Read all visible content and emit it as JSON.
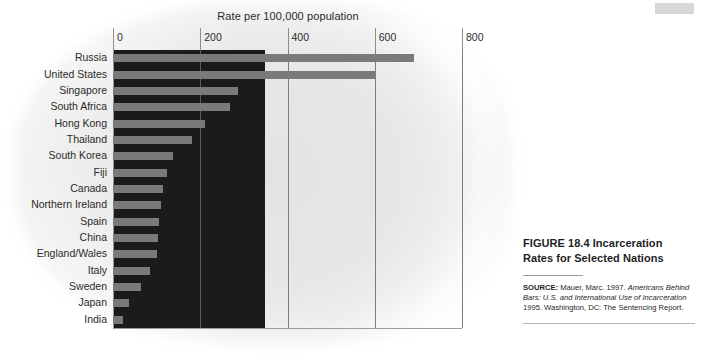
{
  "figure": {
    "caption_title": "FIGURE 18.4 Incarceration Rates for Selected Nations",
    "source_lead": "SOURCE:",
    "source_part1": " Mauer, Marc. 1997. ",
    "source_italic": "Americans Behind Bars: U.S. and International Use of Incarceration",
    "source_part2": " 1995. Washington, DC: The Sentencing Report."
  },
  "colors": {
    "bar": "#7a7a7a",
    "plot_dark": "#1b1b1b",
    "grid": "#7d7d7d",
    "text": "#2b2b2b",
    "corner_tab": "#d8d8d8"
  },
  "chart_data": {
    "type": "bar",
    "orientation": "horizontal",
    "title": "Rate per 100,000 population",
    "xlabel": "Rate per 100,000 population",
    "ylabel": "",
    "xlim": [
      0,
      800
    ],
    "ticks": [
      0,
      200,
      400,
      600,
      800
    ],
    "tick_labels": [
      "0",
      "200",
      "400",
      "600",
      "800"
    ],
    "grid": true,
    "legend": "none",
    "categories": [
      "Russia",
      "United States",
      "Singapore",
      "South Africa",
      "Hong Kong",
      "Thailand",
      "South Korea",
      "Fiji",
      "Canada",
      "Northern Ireland",
      "Spain",
      "China",
      "England/Wales",
      "Italy",
      "Sweden",
      "Japan",
      "India"
    ],
    "values": [
      690,
      600,
      287,
      268,
      212,
      180,
      137,
      123,
      115,
      110,
      105,
      103,
      100,
      85,
      65,
      37,
      24
    ]
  }
}
